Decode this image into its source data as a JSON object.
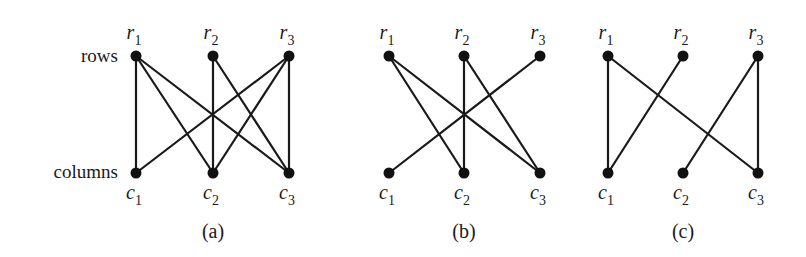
{
  "side_labels": {
    "rows": "rows",
    "columns": "columns"
  },
  "row_prefix": "r",
  "column_prefix": "c",
  "row_y": 56,
  "column_y": 173,
  "colors": {
    "ink": "#1a1a1a",
    "background": "#ffffff"
  },
  "graphs": [
    {
      "caption": "(a)",
      "caption_x": 213,
      "rows": [
        {
          "label": "r",
          "sub": "1",
          "x": 136
        },
        {
          "label": "r",
          "sub": "2",
          "x": 213
        },
        {
          "label": "r",
          "sub": "3",
          "x": 289
        }
      ],
      "columns": [
        {
          "label": "c",
          "sub": "1",
          "x": 136
        },
        {
          "label": "c",
          "sub": "2",
          "x": 213
        },
        {
          "label": "c",
          "sub": "3",
          "x": 289
        }
      ],
      "edges": [
        [
          1,
          1
        ],
        [
          1,
          2
        ],
        [
          1,
          3
        ],
        [
          2,
          2
        ],
        [
          2,
          3
        ],
        [
          3,
          1
        ],
        [
          3,
          2
        ],
        [
          3,
          3
        ]
      ]
    },
    {
      "caption": "(b)",
      "caption_x": 464,
      "rows": [
        {
          "label": "r",
          "sub": "1",
          "x": 389
        },
        {
          "label": "r",
          "sub": "2",
          "x": 464
        },
        {
          "label": "r",
          "sub": "3",
          "x": 540
        }
      ],
      "columns": [
        {
          "label": "c",
          "sub": "1",
          "x": 389
        },
        {
          "label": "c",
          "sub": "2",
          "x": 464
        },
        {
          "label": "c",
          "sub": "3",
          "x": 540
        }
      ],
      "edges": [
        [
          1,
          2
        ],
        [
          1,
          3
        ],
        [
          2,
          2
        ],
        [
          2,
          3
        ],
        [
          3,
          1
        ]
      ]
    },
    {
      "caption": "(c)",
      "caption_x": 683,
      "rows": [
        {
          "label": "r",
          "sub": "1",
          "x": 608
        },
        {
          "label": "r",
          "sub": "2",
          "x": 683
        },
        {
          "label": "r",
          "sub": "3",
          "x": 758
        }
      ],
      "columns": [
        {
          "label": "c",
          "sub": "1",
          "x": 608
        },
        {
          "label": "c",
          "sub": "2",
          "x": 683
        },
        {
          "label": "c",
          "sub": "3",
          "x": 758
        }
      ],
      "edges": [
        [
          1,
          1
        ],
        [
          1,
          3
        ],
        [
          2,
          1
        ],
        [
          3,
          2
        ],
        [
          3,
          3
        ]
      ]
    }
  ]
}
